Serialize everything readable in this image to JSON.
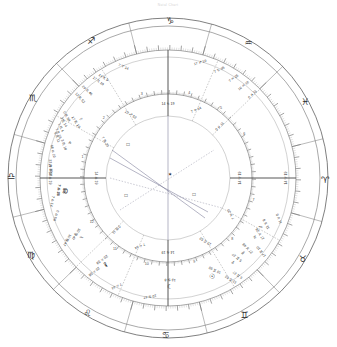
{
  "header": {
    "title": "Natal Chart",
    "subtitle": "astrological wheel"
  },
  "chart_data": {
    "type": "wheel",
    "geometry": {
      "center_x": 168,
      "center_y": 178,
      "r_outer": 160,
      "r_sign_band_outer": 152,
      "r_sign_band_inner": 128,
      "r_degree_tick_outer": 128,
      "r_degree_tick_inner": 121,
      "r_planet_ring_outer": 121,
      "r_planet_ring_inner": 84,
      "r_house_ring_outer": 84,
      "r_house_ring_inner": 62,
      "r_aspect_circle": 62
    },
    "ascendant_longitude": 194.19,
    "zodiac_signs": [
      {
        "name": "Aries",
        "glyph": "♈",
        "start": 0
      },
      {
        "name": "Taurus",
        "glyph": "♉",
        "start": 30
      },
      {
        "name": "Gemini",
        "glyph": "♊",
        "start": 60
      },
      {
        "name": "Cancer",
        "glyph": "♋",
        "start": 90
      },
      {
        "name": "Leo",
        "glyph": "♌",
        "start": 120
      },
      {
        "name": "Virgo",
        "glyph": "♍",
        "start": 150
      },
      {
        "name": "Libra",
        "glyph": "♎",
        "start": 180
      },
      {
        "name": "Scorpio",
        "glyph": "♏",
        "start": 210
      },
      {
        "name": "Sagittarius",
        "glyph": "♐",
        "start": 240
      },
      {
        "name": "Capricorn",
        "glyph": "♑",
        "start": 270
      },
      {
        "name": "Aquarius",
        "glyph": "♒",
        "start": 300
      },
      {
        "name": "Pisces",
        "glyph": "♓",
        "start": 330
      }
    ],
    "planets": [
      {
        "name": "Sun",
        "glyph": "☉",
        "label_deg": "18 ♊ 58",
        "longitude": 78.97
      },
      {
        "name": "Moon",
        "glyph": "☽",
        "label_deg": "13 ♋ 8",
        "longitude": 103.13
      },
      {
        "name": "Mercury",
        "glyph": "☿",
        "label_deg": "27 ♉ 48",
        "longitude": 57.8
      },
      {
        "name": "Venus",
        "glyph": "♀",
        "label_deg": "5 ♊ 27",
        "longitude": 65.45
      },
      {
        "name": "Mars",
        "glyph": "♂",
        "label_deg": "11 ♉ 8",
        "longitude": 41.13
      },
      {
        "name": "Jupiter",
        "glyph": "♃",
        "label_deg": "17 ♉ 28",
        "longitude": 47.47
      },
      {
        "name": "Saturn",
        "glyph": "♄",
        "label_deg": "10 ♍ 47",
        "longitude": 160.78
      },
      {
        "name": "Uranus",
        "glyph": "♅",
        "label_deg": "7 ♎ 35",
        "longitude": 187.58
      },
      {
        "name": "Neptune",
        "glyph": "♆",
        "label_deg": "3 ♏ 14",
        "longitude": 213.23
      },
      {
        "name": "Pluto",
        "glyph": "♇",
        "label_deg": "17 ♏ 19",
        "longitude": 227.32
      },
      {
        "name": "NorthNode",
        "glyph": "☊",
        "label_deg": "7 ♎ 18",
        "longitude": 187.3
      },
      {
        "name": "Chiron",
        "glyph": "⚷",
        "label_deg": "20 ♌ 58",
        "longitude": 140.97
      }
    ],
    "planet_clusters": [
      {
        "anchor_longitude": 80.0,
        "members": [
          {
            "glyph": "☿",
            "name": "Mercury",
            "lines": [
              "27 ♉ 48",
              "2 ♊ 5"
            ]
          },
          {
            "glyph": "☉",
            "name": "Sun",
            "lines": [
              "18 ♊ 58",
              "20 ♊ 3"
            ]
          },
          {
            "glyph": "☽",
            "name": "Moon",
            "lines": [
              "13 ♋ 8",
              "7 ♋ 4"
            ]
          },
          {
            "glyph": "☊",
            "name": "NorthNode",
            "lines": [
              "7 ♋ 44"
            ]
          }
        ]
      }
    ],
    "outer_degree_labels": [
      {
        "text": "17 ♊ 10",
        "longitude": 52.0
      },
      {
        "text": "11 ♉ 8",
        "longitude": 34.0
      },
      {
        "text": "0 ♓ 11",
        "longitude": 330.0
      },
      {
        "text": "5 ♊ 27",
        "longitude": 68.0
      },
      {
        "text": "12 ♊ 52",
        "longitude": 72.0
      },
      {
        "text": "7 ♎ 14",
        "longitude": 183.0
      },
      {
        "text": "14 ♎ 19",
        "longitude": 194.19
      },
      {
        "text": "10 ♍ 47",
        "longitude": 163.0
      },
      {
        "text": "0 ♎ 58",
        "longitude": 176.0
      },
      {
        "text": "21 ♎ 57",
        "longitude": 198.0
      },
      {
        "text": "22 ♎ 35",
        "longitude": 200.0
      },
      {
        "text": "60 ♎ 10",
        "longitude": 207.0
      },
      {
        "text": "0 ♏ 11",
        "longitude": 214.0
      },
      {
        "text": "7 ♏ 23",
        "longitude": 216.0
      },
      {
        "text": "1 ♏ 4",
        "longitude": 219.0
      },
      {
        "text": "3 ♏ 14",
        "longitude": 222.0
      },
      {
        "text": "0 ♏ 58",
        "longitude": 225.0
      },
      {
        "text": "12 ♏ 52",
        "longitude": 236.0
      },
      {
        "text": "29 ♏ 46",
        "longitude": 241.0
      },
      {
        "text": "17 ♏ 19",
        "longitude": 248.0
      },
      {
        "text": "14 ♏ 9",
        "longitude": 251.0
      },
      {
        "text": "7 ♈ 14",
        "longitude": 262.0
      },
      {
        "text": "14 ♈ 19",
        "longitude": 14.19
      },
      {
        "text": "17 ♐ 10",
        "longitude": 300.0
      },
      {
        "text": "7 ♑ 35",
        "longitude": 310.0
      },
      {
        "text": "7 ♒ 25",
        "longitude": 318.0
      },
      {
        "text": "10 ♒ 10",
        "longitude": 324.0
      },
      {
        "text": "20 ♌ 58",
        "longitude": 143.0
      },
      {
        "text": "7 ♌ 44",
        "longitude": 130.0
      },
      {
        "text": "10 ♋ 47",
        "longitude": 113.0
      }
    ],
    "houses": [
      {
        "number": 1,
        "cusp_deg": "14 ♎ 19",
        "longitude": 194.19
      },
      {
        "number": 2,
        "cusp_deg": "7 ♏ 23",
        "longitude": 223.38
      },
      {
        "number": 3,
        "cusp_deg": "12 ♐ 52",
        "longitude": 252.87
      },
      {
        "number": 4,
        "cusp_deg": "14 ♑ 19",
        "longitude": 284.19
      },
      {
        "number": 5,
        "cusp_deg": "7 ♒ 14",
        "longitude": 307.23
      },
      {
        "number": 6,
        "cusp_deg": "0 ♓ 11",
        "longitude": 330.18
      },
      {
        "number": 7,
        "cusp_deg": "14 ♈ 19",
        "longitude": 14.19
      },
      {
        "number": 8,
        "cusp_deg": "7 ♉ 23",
        "longitude": 43.38
      },
      {
        "number": 9,
        "cusp_deg": "12 ♊ 52",
        "longitude": 72.87
      },
      {
        "number": 10,
        "cusp_deg": "14 ♋ 19",
        "longitude": 104.19
      },
      {
        "number": 11,
        "cusp_deg": "7 ♌ 14",
        "longitude": 127.23
      },
      {
        "number": 12,
        "cusp_deg": "0 ♍ 11",
        "longitude": 150.18
      }
    ],
    "house_numbers": [
      1,
      2,
      3,
      4,
      5,
      6,
      7,
      8,
      9,
      10,
      11,
      12
    ],
    "aspect_symbols": [
      {
        "glyph": "□",
        "name": "square",
        "x": 128,
        "y": 146
      },
      {
        "glyph": "□",
        "name": "square",
        "x": 126,
        "y": 197
      },
      {
        "glyph": "□",
        "name": "square",
        "x": 194,
        "y": 196
      },
      {
        "glyph": "✶",
        "name": "sextile",
        "x": 170,
        "y": 176
      }
    ],
    "aspect_lines": [
      {
        "x1": 112,
        "y1": 150,
        "x2": 205,
        "y2": 218,
        "style": "solid"
      },
      {
        "x1": 110,
        "y1": 158,
        "x2": 208,
        "y2": 212,
        "style": "solid"
      },
      {
        "x1": 168,
        "y1": 116,
        "x2": 168,
        "y2": 240,
        "style": "solid"
      },
      {
        "x1": 110,
        "y1": 178,
        "x2": 222,
        "y2": 208,
        "style": "dashed"
      },
      {
        "x1": 120,
        "y1": 210,
        "x2": 214,
        "y2": 150,
        "style": "dashed"
      }
    ]
  },
  "colors": {
    "background": "#ffffff",
    "ring_stroke": "#6e6e6e",
    "text": "#1a1a1a",
    "aspect": "#6b6b8a"
  }
}
